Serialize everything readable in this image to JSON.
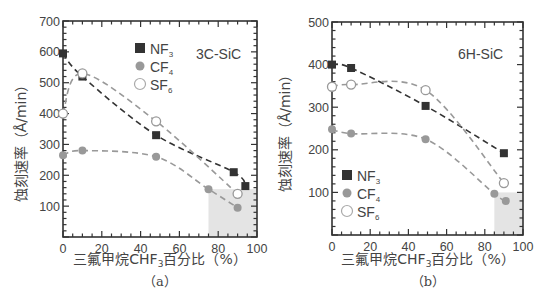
{
  "chart_data": [
    {
      "type": "line",
      "panel": "(a)",
      "annotation": "3C-SiC",
      "xlabel": "三氟甲烷CHF3百分比（%）",
      "ylabel": "蚀刻速率（Å/min）",
      "xlim": [
        0,
        100
      ],
      "ylim": [
        0,
        700
      ],
      "xticks": [
        0,
        20,
        40,
        60,
        80,
        100
      ],
      "yticks": [
        100,
        200,
        300,
        400,
        500,
        600,
        700
      ],
      "legend": [
        "NF3",
        "CF4",
        "SF6"
      ],
      "legend_position": "upper center",
      "highlight_region": {
        "x": [
          75,
          100
        ],
        "y": [
          0,
          155
        ]
      },
      "series": [
        {
          "name": "NF3",
          "marker": "filled-square",
          "color": "#333333",
          "x": [
            0,
            10,
            48,
            88,
            94
          ],
          "y": [
            595,
            520,
            330,
            210,
            165
          ]
        },
        {
          "name": "CF4",
          "marker": "filled-circle",
          "color": "#999999",
          "x": [
            0,
            10,
            48,
            75,
            90
          ],
          "y": [
            265,
            280,
            260,
            155,
            95
          ]
        },
        {
          "name": "SF6",
          "marker": "open-circle",
          "color": "#999999",
          "x": [
            0,
            10,
            48,
            90
          ],
          "y": [
            400,
            530,
            375,
            140
          ]
        }
      ]
    },
    {
      "type": "line",
      "panel": "(b)",
      "annotation": "6H-SiC",
      "xlabel": "三氟甲烷CHF3百分比（%）",
      "ylabel": "蚀刻速率（Å/min）",
      "xlim": [
        0,
        100
      ],
      "ylim": [
        0,
        500
      ],
      "xticks": [
        0,
        20,
        40,
        60,
        80,
        100
      ],
      "yticks": [
        100,
        200,
        300,
        400,
        500
      ],
      "legend": [
        "NF3",
        "CF4",
        "SF6"
      ],
      "legend_position": "lower left",
      "highlight_region": {
        "x": [
          85,
          100
        ],
        "y": [
          0,
          100
        ]
      },
      "series": [
        {
          "name": "NF3",
          "marker": "filled-square",
          "color": "#333333",
          "x": [
            0,
            10,
            49,
            90
          ],
          "y": [
            400,
            392,
            303,
            192
          ]
        },
        {
          "name": "CF4",
          "marker": "filled-circle",
          "color": "#999999",
          "x": [
            0,
            10,
            49,
            85,
            91
          ],
          "y": [
            248,
            238,
            225,
            97,
            80
          ]
        },
        {
          "name": "SF6",
          "marker": "open-circle",
          "color": "#999999",
          "x": [
            0,
            10,
            49,
            90
          ],
          "y": [
            348,
            353,
            340,
            122
          ]
        }
      ]
    }
  ],
  "labels": {
    "a": {
      "panel": "（a）",
      "annotation": "3C-SiC",
      "xlabel_pre": "三氟甲烷CHF",
      "xlabel_sub": "3",
      "xlabel_post": "百分比（%）",
      "ylabel": "蚀刻速率（Å/min）",
      "legend": [
        {
          "name": "NF",
          "sub": "3"
        },
        {
          "name": "CF",
          "sub": "4"
        },
        {
          "name": "SF",
          "sub": "6"
        }
      ],
      "xticks": [
        "0",
        "20",
        "40",
        "60",
        "80",
        "100"
      ],
      "yticks": [
        "100",
        "200",
        "300",
        "400",
        "500",
        "600",
        "700"
      ]
    },
    "b": {
      "panel": "（b）",
      "annotation": "6H-SiC",
      "xlabel_pre": "三氟甲烷CHF",
      "xlabel_sub": "3",
      "xlabel_post": "百分比（%）",
      "ylabel": "蚀刻速率（Å/min）",
      "legend": [
        {
          "name": "NF",
          "sub": "3"
        },
        {
          "name": "CF",
          "sub": "4"
        },
        {
          "name": "SF",
          "sub": "6"
        }
      ],
      "xticks": [
        "0",
        "20",
        "40",
        "60",
        "80",
        "100"
      ],
      "yticks": [
        "100",
        "200",
        "300",
        "400",
        "500"
      ]
    }
  },
  "colors": {
    "axis": "#333333",
    "nf3": "#333333",
    "cf4": "#999999",
    "sf6": "#999999",
    "highlight": "#e4e4e4"
  }
}
